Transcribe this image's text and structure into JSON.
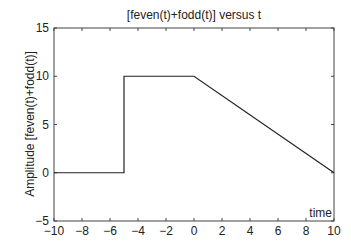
{
  "chart_data": {
    "type": "line",
    "title": "[feven(t)+fodd(t)] versus t",
    "xlabel": "time",
    "ylabel": "Amplitude [feven(t)+fodd(t)]",
    "xlim": [
      -10,
      10
    ],
    "ylim": [
      -5,
      15
    ],
    "x_ticks": [
      -10,
      -8,
      -6,
      -4,
      -2,
      0,
      2,
      4,
      6,
      8,
      10
    ],
    "y_ticks": [
      -5,
      0,
      5,
      10,
      15
    ],
    "grid": false,
    "series": [
      {
        "name": "feven(t)+fodd(t)",
        "color": "#222222",
        "x": [
          -10,
          -5,
          -5,
          0,
          10
        ],
        "y": [
          0,
          0,
          10,
          10,
          0
        ]
      }
    ]
  }
}
